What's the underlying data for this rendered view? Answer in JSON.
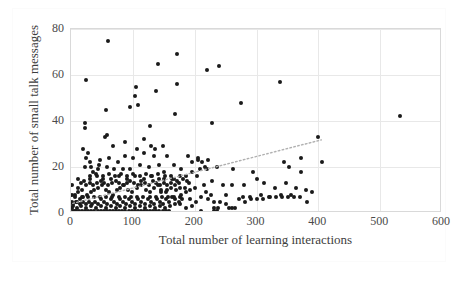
{
  "chart_data": {
    "type": "scatter",
    "title": "",
    "xlabel": "Total number of learning interactions",
    "ylabel": "Total number of small talk messages",
    "xlim": [
      0,
      600
    ],
    "ylim": [
      0,
      80
    ],
    "xticks": [
      0,
      100,
      200,
      300,
      400,
      500,
      600
    ],
    "yticks": [
      0,
      20,
      40,
      60,
      80
    ],
    "grid": true,
    "legend": null,
    "marker_color": "#1a1a1a",
    "trendline": {
      "style": "dotted",
      "color": "#b0b0b0",
      "x": [
        3,
        405
      ],
      "y": [
        4.2,
        31.8
      ],
      "slope": 0.0687,
      "intercept": 4.0
    },
    "points": [
      [
        60,
        75
      ],
      [
        25,
        58
      ],
      [
        172,
        69
      ],
      [
        140,
        65
      ],
      [
        240,
        64
      ],
      [
        220,
        62
      ],
      [
        338,
        57
      ],
      [
        105,
        55
      ],
      [
        172,
        56
      ],
      [
        138,
        53
      ],
      [
        103,
        51
      ],
      [
        95,
        46
      ],
      [
        108,
        47
      ],
      [
        57,
        45
      ],
      [
        532,
        42
      ],
      [
        168,
        43
      ],
      [
        228,
        39
      ],
      [
        275,
        48
      ],
      [
        400,
        33
      ],
      [
        23,
        39
      ],
      [
        22,
        37
      ],
      [
        20,
        28
      ],
      [
        128,
        38
      ],
      [
        58,
        34
      ],
      [
        55,
        33
      ],
      [
        25,
        24
      ],
      [
        118,
        32
      ],
      [
        88,
        31
      ],
      [
        130,
        29
      ],
      [
        148,
        29
      ],
      [
        68,
        29
      ],
      [
        28,
        26
      ],
      [
        118,
        26
      ],
      [
        30,
        22
      ],
      [
        47,
        23
      ],
      [
        62,
        24
      ],
      [
        88,
        25
      ],
      [
        100,
        24
      ],
      [
        135,
        25
      ],
      [
        155,
        25
      ],
      [
        190,
        25
      ],
      [
        205,
        24
      ],
      [
        222,
        23
      ],
      [
        212,
        22
      ],
      [
        220,
        19
      ],
      [
        236,
        20
      ],
      [
        262,
        19
      ],
      [
        295,
        18
      ],
      [
        352,
        20
      ],
      [
        372,
        18
      ],
      [
        406,
        22
      ],
      [
        372,
        24
      ],
      [
        345,
        22
      ],
      [
        208,
        19
      ],
      [
        178,
        19
      ],
      [
        166,
        21
      ],
      [
        143,
        21
      ],
      [
        150,
        18
      ],
      [
        126,
        20
      ],
      [
        112,
        21
      ],
      [
        96,
        19
      ],
      [
        84,
        19
      ],
      [
        70,
        19
      ],
      [
        58,
        20
      ],
      [
        44,
        19
      ],
      [
        36,
        18
      ],
      [
        30,
        16
      ],
      [
        42,
        16
      ],
      [
        52,
        15
      ],
      [
        65,
        15
      ],
      [
        78,
        16
      ],
      [
        90,
        15
      ],
      [
        104,
        16
      ],
      [
        118,
        15
      ],
      [
        130,
        16
      ],
      [
        142,
        15
      ],
      [
        152,
        16
      ],
      [
        164,
        15
      ],
      [
        176,
        16
      ],
      [
        188,
        14
      ],
      [
        196,
        18
      ],
      [
        204,
        16
      ],
      [
        215,
        12
      ],
      [
        228,
        14
      ],
      [
        246,
        12
      ],
      [
        260,
        12
      ],
      [
        280,
        12
      ],
      [
        300,
        15
      ],
      [
        312,
        13
      ],
      [
        330,
        11
      ],
      [
        348,
        13
      ],
      [
        364,
        11
      ],
      [
        380,
        10
      ],
      [
        390,
        9
      ],
      [
        356,
        8
      ],
      [
        340,
        8
      ],
      [
        322,
        7
      ],
      [
        308,
        8
      ],
      [
        290,
        7
      ],
      [
        278,
        7
      ],
      [
        265,
        2
      ],
      [
        250,
        8
      ],
      [
        238,
        2
      ],
      [
        232,
        2
      ],
      [
        226,
        8
      ],
      [
        218,
        9
      ],
      [
        210,
        1
      ],
      [
        200,
        0
      ],
      [
        196,
        3
      ],
      [
        186,
        2
      ],
      [
        176,
        4
      ],
      [
        168,
        4
      ],
      [
        160,
        3
      ],
      [
        152,
        2
      ],
      [
        144,
        3
      ],
      [
        136,
        2
      ],
      [
        128,
        3
      ],
      [
        120,
        2
      ],
      [
        112,
        3
      ],
      [
        104,
        2
      ],
      [
        96,
        3
      ],
      [
        88,
        2
      ],
      [
        80,
        3
      ],
      [
        72,
        2
      ],
      [
        64,
        3
      ],
      [
        56,
        2
      ],
      [
        48,
        3
      ],
      [
        40,
        2
      ],
      [
        32,
        3
      ],
      [
        24,
        2
      ],
      [
        16,
        3
      ],
      [
        10,
        2
      ],
      [
        6,
        1
      ],
      [
        4,
        3
      ],
      [
        8,
        5
      ],
      [
        14,
        6
      ],
      [
        20,
        7
      ],
      [
        26,
        8
      ],
      [
        33,
        9
      ],
      [
        38,
        10
      ],
      [
        44,
        11
      ],
      [
        50,
        12
      ],
      [
        56,
        10
      ],
      [
        62,
        9
      ],
      [
        68,
        8
      ],
      [
        74,
        10
      ],
      [
        80,
        11
      ],
      [
        86,
        12
      ],
      [
        92,
        10
      ],
      [
        98,
        9
      ],
      [
        106,
        11
      ],
      [
        114,
        12
      ],
      [
        122,
        10
      ],
      [
        128,
        9
      ],
      [
        134,
        11
      ],
      [
        140,
        12
      ],
      [
        146,
        10
      ],
      [
        154,
        9
      ],
      [
        162,
        11
      ],
      [
        170,
        10
      ],
      [
        178,
        8
      ],
      [
        184,
        11
      ],
      [
        192,
        10
      ],
      [
        6,
        8
      ],
      [
        12,
        9
      ],
      [
        18,
        10
      ],
      [
        24,
        12
      ],
      [
        30,
        13
      ],
      [
        36,
        12
      ],
      [
        42,
        13
      ],
      [
        48,
        14
      ],
      [
        54,
        13
      ],
      [
        60,
        12
      ],
      [
        66,
        13
      ],
      [
        72,
        14
      ],
      [
        78,
        13
      ],
      [
        84,
        12
      ],
      [
        90,
        13
      ],
      [
        96,
        14
      ],
      [
        102,
        13
      ],
      [
        108,
        12
      ],
      [
        114,
        14
      ],
      [
        120,
        13
      ],
      [
        126,
        12
      ],
      [
        132,
        14
      ],
      [
        138,
        13
      ],
      [
        144,
        12
      ],
      [
        150,
        13
      ],
      [
        156,
        12
      ],
      [
        162,
        13
      ],
      [
        168,
        12
      ],
      [
        174,
        13
      ],
      [
        5,
        0
      ],
      [
        10,
        0
      ],
      [
        15,
        0
      ],
      [
        20,
        0
      ],
      [
        25,
        0
      ],
      [
        30,
        0
      ],
      [
        35,
        0
      ],
      [
        40,
        0
      ],
      [
        45,
        0
      ],
      [
        50,
        0
      ],
      [
        55,
        0
      ],
      [
        60,
        0
      ],
      [
        65,
        0
      ],
      [
        70,
        0
      ],
      [
        75,
        0
      ],
      [
        80,
        0
      ],
      [
        85,
        0
      ],
      [
        90,
        0
      ],
      [
        95,
        0
      ],
      [
        100,
        0
      ],
      [
        105,
        0
      ],
      [
        110,
        0
      ],
      [
        115,
        0
      ],
      [
        120,
        0
      ],
      [
        125,
        0
      ],
      [
        130,
        0
      ],
      [
        135,
        0
      ],
      [
        140,
        0
      ],
      [
        145,
        0
      ],
      [
        150,
        0
      ],
      [
        155,
        0
      ],
      [
        160,
        0
      ],
      [
        165,
        0
      ],
      [
        170,
        0
      ],
      [
        3,
        1
      ],
      [
        8,
        1
      ],
      [
        13,
        1
      ],
      [
        18,
        1
      ],
      [
        23,
        1
      ],
      [
        28,
        1
      ],
      [
        33,
        1
      ],
      [
        38,
        1
      ],
      [
        43,
        1
      ],
      [
        48,
        1
      ],
      [
        53,
        1
      ],
      [
        58,
        1
      ],
      [
        63,
        1
      ],
      [
        68,
        1
      ],
      [
        73,
        1
      ],
      [
        78,
        1
      ],
      [
        83,
        1
      ],
      [
        88,
        1
      ],
      [
        93,
        1
      ],
      [
        98,
        1
      ],
      [
        103,
        1
      ],
      [
        108,
        1
      ],
      [
        113,
        1
      ],
      [
        118,
        1
      ],
      [
        123,
        1
      ],
      [
        128,
        1
      ],
      [
        133,
        1
      ],
      [
        138,
        1
      ],
      [
        143,
        1
      ],
      [
        148,
        1
      ],
      [
        153,
        1
      ],
      [
        158,
        1
      ],
      [
        4,
        4
      ],
      [
        9,
        5
      ],
      [
        14,
        4
      ],
      [
        19,
        5
      ],
      [
        24,
        4
      ],
      [
        29,
        5
      ],
      [
        34,
        4
      ],
      [
        39,
        5
      ],
      [
        44,
        4
      ],
      [
        49,
        6
      ],
      [
        54,
        5
      ],
      [
        59,
        4
      ],
      [
        64,
        6
      ],
      [
        69,
        5
      ],
      [
        74,
        4
      ],
      [
        79,
        6
      ],
      [
        84,
        5
      ],
      [
        89,
        4
      ],
      [
        94,
        6
      ],
      [
        99,
        5
      ],
      [
        104,
        4
      ],
      [
        109,
        6
      ],
      [
        114,
        5
      ],
      [
        119,
        4
      ],
      [
        124,
        6
      ],
      [
        129,
        5
      ],
      [
        134,
        4
      ],
      [
        139,
        6
      ],
      [
        144,
        5
      ],
      [
        149,
        4
      ],
      [
        154,
        6
      ],
      [
        159,
        5
      ],
      [
        164,
        7
      ],
      [
        169,
        6
      ],
      [
        174,
        5
      ],
      [
        180,
        6
      ],
      [
        7,
        7
      ],
      [
        17,
        7
      ],
      [
        27,
        7
      ],
      [
        37,
        7
      ],
      [
        47,
        7
      ],
      [
        57,
        7
      ],
      [
        67,
        7
      ],
      [
        77,
        7
      ],
      [
        87,
        7
      ],
      [
        97,
        7
      ],
      [
        107,
        7
      ],
      [
        117,
        7
      ],
      [
        127,
        7
      ],
      [
        137,
        7
      ],
      [
        147,
        7
      ],
      [
        157,
        7
      ],
      [
        167,
        7
      ],
      [
        177,
        7
      ],
      [
        11,
        15
      ],
      [
        21,
        14
      ],
      [
        31,
        15
      ],
      [
        41,
        17
      ],
      [
        51,
        16
      ],
      [
        61,
        17
      ],
      [
        71,
        16
      ],
      [
        81,
        17
      ],
      [
        91,
        16
      ],
      [
        101,
        17
      ],
      [
        111,
        16
      ],
      [
        121,
        17
      ],
      [
        131,
        16
      ],
      [
        141,
        17
      ],
      [
        151,
        15
      ],
      [
        161,
        16
      ],
      [
        171,
        14
      ],
      [
        181,
        15
      ],
      [
        191,
        13
      ],
      [
        201,
        11
      ],
      [
        211,
        7
      ],
      [
        221,
        6
      ],
      [
        231,
        5
      ],
      [
        241,
        5
      ],
      [
        251,
        4
      ],
      [
        261,
        2
      ],
      [
        271,
        6
      ],
      [
        281,
        5
      ],
      [
        291,
        6
      ],
      [
        301,
        6
      ],
      [
        311,
        6
      ],
      [
        321,
        7
      ],
      [
        331,
        7
      ],
      [
        341,
        7
      ],
      [
        351,
        7
      ],
      [
        361,
        7
      ],
      [
        371,
        7
      ],
      [
        381,
        5
      ],
      [
        391,
        0
      ],
      [
        2,
        12
      ],
      [
        2,
        8
      ],
      [
        2,
        5
      ],
      [
        2,
        2
      ],
      [
        2,
        0
      ],
      [
        12,
        11
      ],
      [
        22,
        20
      ],
      [
        32,
        20
      ],
      [
        16,
        13
      ],
      [
        46,
        21
      ],
      [
        76,
        22
      ],
      [
        106,
        28
      ],
      [
        136,
        28
      ],
      [
        166,
        15
      ],
      [
        186,
        16
      ],
      [
        196,
        22
      ],
      [
        206,
        23
      ],
      [
        216,
        20
      ],
      [
        236,
        1
      ],
      [
        256,
        2
      ],
      [
        186,
        9
      ],
      [
        146,
        9
      ],
      [
        156,
        10
      ],
      [
        176,
        11
      ],
      [
        192,
        6
      ],
      [
        202,
        5
      ],
      [
        232,
        1
      ]
    ]
  },
  "axis": {
    "x_tick_labels": [
      "0",
      "100",
      "200",
      "300",
      "400",
      "500",
      "600"
    ],
    "y_tick_labels": [
      "0",
      "20",
      "40",
      "60",
      "80"
    ]
  }
}
